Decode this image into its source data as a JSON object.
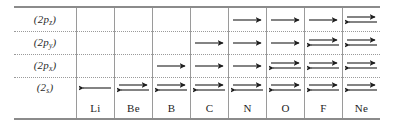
{
  "figure": {
    "kind": "orbital-occupancy-table",
    "colors": {
      "rule": "#8b8b8b",
      "column_divider": "#9a9a9a",
      "dotted_separator": "#9a9a9a",
      "arrow": "#1e1e1e",
      "text": "#1e1e1e",
      "background": "#ffffff"
    }
  },
  "rows": [
    {
      "id": "2pz",
      "label_main": "(2p",
      "label_sub": "z",
      "label_close": ")"
    },
    {
      "id": "2py",
      "label_main": "(2p",
      "label_sub": "y",
      "label_close": ")"
    },
    {
      "id": "2px",
      "label_main": "(2p",
      "label_sub": "x",
      "label_close": ")"
    },
    {
      "id": "2s",
      "label_main": "(2",
      "label_sub": "s",
      "label_close": ")"
    }
  ],
  "columns": [
    {
      "symbol": "Li"
    },
    {
      "symbol": "Be"
    },
    {
      "symbol": "B"
    },
    {
      "symbol": "C"
    },
    {
      "symbol": "N"
    },
    {
      "symbol": "O"
    },
    {
      "symbol": "F"
    },
    {
      "symbol": "Ne"
    }
  ],
  "chart_data": {
    "type": "table",
    "title": "",
    "row_labels": [
      "(2p_z)",
      "(2p_y)",
      "(2p_x)",
      "(2s)"
    ],
    "categories": [
      "Li",
      "Be",
      "B",
      "C",
      "N",
      "O",
      "F",
      "Ne"
    ],
    "legend": {
      "empty": "no electron in orbital",
      "single": "one electron (single arrow)",
      "paired": "two paired electrons (opposed arrows)"
    },
    "occupancy": {
      "2pz": [
        "empty",
        "empty",
        "empty",
        "empty",
        "single",
        "single",
        "single",
        "paired"
      ],
      "2py": [
        "empty",
        "empty",
        "empty",
        "single",
        "single",
        "single",
        "paired",
        "paired"
      ],
      "2px": [
        "empty",
        "empty",
        "single",
        "single",
        "single",
        "paired",
        "paired",
        "paired"
      ],
      "2s": [
        "single-left",
        "paired",
        "paired",
        "paired",
        "paired",
        "paired",
        "paired",
        "paired"
      ]
    },
    "electron_counts": {
      "2pz": [
        0,
        0,
        0,
        0,
        1,
        1,
        1,
        2
      ],
      "2py": [
        0,
        0,
        0,
        1,
        1,
        1,
        2,
        2
      ],
      "2px": [
        0,
        0,
        1,
        1,
        1,
        2,
        2,
        2
      ],
      "2s": [
        1,
        2,
        2,
        2,
        2,
        2,
        2,
        2
      ]
    }
  }
}
